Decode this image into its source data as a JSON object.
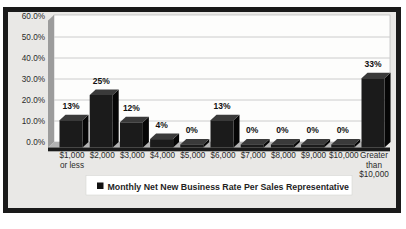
{
  "figure": {
    "frame_color": "#1a1a1a",
    "background_color": "#e9e8e6",
    "plot_background": "#fdfdfc",
    "gridline_color": "#cccccc",
    "wall_color": "#9c9c9c",
    "floor_color": "#b3b3b3",
    "text_color": "#2a2a2a",
    "legend_marker_color": "#111111"
  },
  "chart_data": {
    "type": "bar",
    "style": "3d-column",
    "title": "",
    "xlabel": "",
    "ylabel": "",
    "categories": [
      "$1,000 or less",
      "$2,000",
      "$3,000",
      "$4,000",
      "$5,000",
      "$6,000",
      "$7,000",
      "$8,000",
      "$9,000",
      "$10,000",
      "Greater than $10,000"
    ],
    "category_lines": [
      [
        "$1,000",
        "or less"
      ],
      [
        "$2,000"
      ],
      [
        "$3,000"
      ],
      [
        "$4,000"
      ],
      [
        "$5,000"
      ],
      [
        "$6,000"
      ],
      [
        "$7,000"
      ],
      [
        "$8,000"
      ],
      [
        "$9,000"
      ],
      [
        "$10,000"
      ],
      [
        "Greater",
        "than",
        "$10,000"
      ]
    ],
    "series": [
      {
        "name": "Monthly Net New Business Rate Per Sales Representative",
        "values": [
          13,
          25,
          12,
          4,
          0,
          13,
          0,
          0,
          0,
          0,
          33
        ]
      }
    ],
    "data_labels": [
      "13%",
      "25%",
      "12%",
      "4%",
      "0%",
      "13%",
      "0%",
      "0%",
      "0%",
      "0%",
      "33%"
    ],
    "ylim": [
      0,
      60
    ],
    "y_tick_step": 10,
    "y_ticks": [
      "60.0%",
      "50.0%",
      "40.0%",
      "30.0%",
      "20.0%",
      "10.0%",
      "0.0%"
    ],
    "grid": true,
    "legend": [
      "Monthly Net New Business Rate Per Sales Representative"
    ],
    "legend_position": "bottom",
    "bar_color": "#1b1b1b",
    "bar_top_color": "#3a3a3a",
    "bar_side_color": "#060606"
  }
}
